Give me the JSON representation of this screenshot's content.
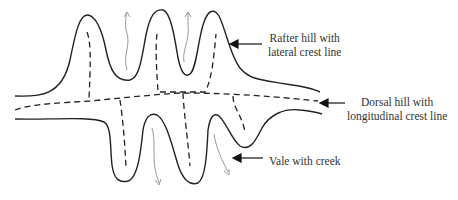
{
  "diagram": {
    "type": "landform-schematic",
    "colors": {
      "outline": "#222222",
      "crest_line": "#222222",
      "drainage_arrow": "#999999",
      "label_text": "#333333"
    },
    "labels": {
      "rafter_hill": {
        "line1": "Rafter hill with",
        "line2": "lateral crest line"
      },
      "dorsal_hill": {
        "line1": "Dorsal hill with",
        "line2": "longitudinal crest line"
      },
      "vale": {
        "line1": "Vale with creek"
      }
    },
    "legend": {
      "solid_line": "hill outline",
      "dashed_line": "crest line",
      "grey_arrow": "creek / drainage direction"
    }
  }
}
